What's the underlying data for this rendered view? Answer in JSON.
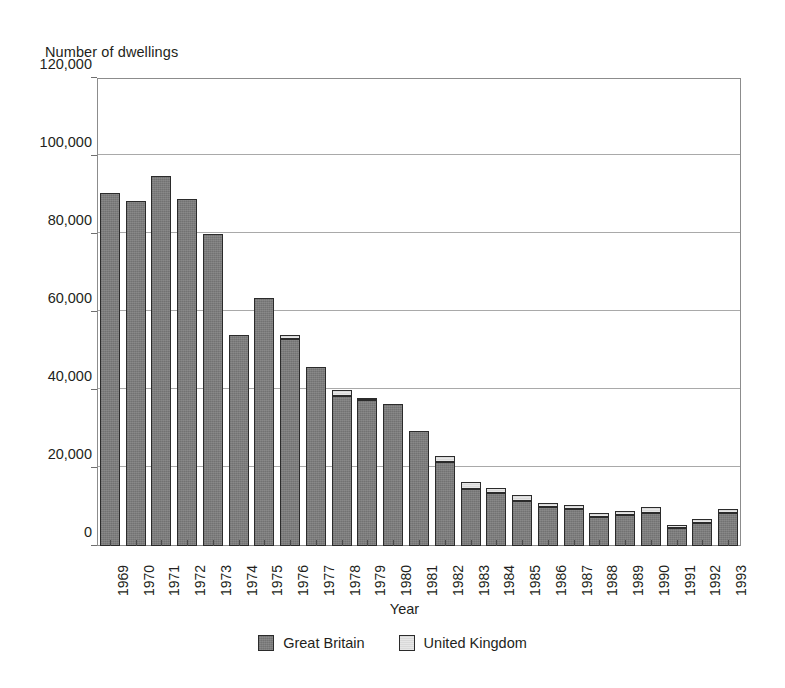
{
  "chart_data": {
    "type": "bar",
    "stacked": true,
    "title": "",
    "subtitle": "",
    "ylabel": "Number of dwellings",
    "xlabel": "Year",
    "ylim": [
      0,
      120000
    ],
    "ytick_values": [
      0,
      20000,
      40000,
      60000,
      80000,
      100000,
      120000
    ],
    "ytick_labels": [
      "0",
      "20,000",
      "40,000",
      "60,000",
      "80,000",
      "100,000",
      "120,000"
    ],
    "grid": true,
    "grid_axis": "y",
    "legend_position": "bottom-center",
    "categories": [
      "1969",
      "1970",
      "1971",
      "1972",
      "1973",
      "1974",
      "1975",
      "1976",
      "1977",
      "1978",
      "1979",
      "1980",
      "1981",
      "1982",
      "1983",
      "1984",
      "1985",
      "1986",
      "1987",
      "1988",
      "1989",
      "1990",
      "1991",
      "1992",
      "1993"
    ],
    "series": [
      {
        "name": "Great Britain",
        "color": "#7c7c7c",
        "values": [
          90500,
          88500,
          95000,
          89000,
          80000,
          54000,
          63500,
          53000,
          46000,
          38500,
          37500,
          36500,
          29500,
          21500,
          14500,
          13500,
          11500,
          10000,
          9500,
          7500,
          8000,
          8500,
          4500,
          6000,
          8500
        ]
      },
      {
        "name": "United Kingdom",
        "color": "#d9d9d9",
        "values": [
          0,
          0,
          0,
          0,
          0,
          0,
          0,
          1000,
          0,
          1500,
          500,
          0,
          0,
          1500,
          2000,
          1500,
          1500,
          1000,
          1000,
          1000,
          1000,
          1500,
          1000,
          1000,
          1000
        ]
      }
    ],
    "totals": [
      90500,
      88500,
      95000,
      89000,
      80000,
      54000,
      63500,
      54000,
      46000,
      40000,
      38000,
      36500,
      29500,
      23000,
      16500,
      15000,
      13000,
      11000,
      10500,
      8500,
      9000,
      10000,
      5500,
      7000,
      9500
    ]
  },
  "legend": {
    "entries": [
      {
        "label": "Great Britain",
        "color": "#7c7c7c",
        "swatch": "legend-swatch-great-britain"
      },
      {
        "label": "United Kingdom",
        "color": "#d9d9d9",
        "swatch": "legend-swatch-united-kingdom"
      }
    ]
  },
  "axes": {
    "y_title": "Number of dwellings",
    "x_title": "Year"
  },
  "colors": {
    "great_britain": "#7c7c7c",
    "united_kingdom": "#d9d9d9",
    "bar_outline": "#2b2b2b",
    "gridline": "#a9a9a9",
    "frame": "#8c8c8c",
    "text": "#231f20",
    "background": "#ffffff"
  }
}
